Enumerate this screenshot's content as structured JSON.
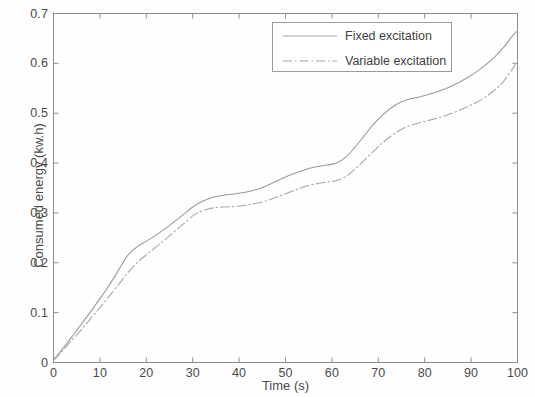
{
  "chart_data": {
    "type": "line",
    "title": "",
    "xlabel": "Time (s)",
    "ylabel": "Consumed energy (kw.h)",
    "xlim": [
      0,
      100
    ],
    "ylim": [
      0,
      0.7
    ],
    "xticks": [
      "0",
      "10",
      "20",
      "30",
      "40",
      "50",
      "60",
      "70",
      "80",
      "90",
      "100"
    ],
    "xtick_values": [
      0,
      10,
      20,
      30,
      40,
      50,
      60,
      70,
      80,
      90,
      100
    ],
    "yticks": [
      "0",
      "0.1",
      "0.2",
      "0.3",
      "0.4",
      "0.5",
      "0.6",
      "0.7"
    ],
    "ytick_values": [
      0,
      0.1,
      0.2,
      0.3,
      0.4,
      0.5,
      0.6,
      0.7
    ],
    "grid": false,
    "legend_position": "top-right",
    "x": [
      0,
      2,
      4,
      6,
      8,
      10,
      12,
      14,
      16,
      18,
      20,
      22,
      24,
      26,
      28,
      30,
      31,
      33,
      35,
      37,
      39,
      41,
      43,
      45,
      47,
      49,
      51,
      53,
      55,
      57,
      59,
      61,
      63,
      65,
      67,
      69,
      71,
      73,
      75,
      77,
      79,
      81,
      83,
      85,
      87,
      89,
      91,
      93,
      95,
      97,
      99,
      100
    ],
    "series": [
      {
        "name": "Fixed excitation",
        "style": "solid",
        "color": "#9a9a9a",
        "values": [
          0.005,
          0.028,
          0.052,
          0.077,
          0.102,
          0.128,
          0.155,
          0.185,
          0.215,
          0.232,
          0.243,
          0.255,
          0.268,
          0.282,
          0.297,
          0.312,
          0.318,
          0.327,
          0.333,
          0.336,
          0.338,
          0.341,
          0.345,
          0.351,
          0.359,
          0.368,
          0.376,
          0.383,
          0.389,
          0.393,
          0.396,
          0.4,
          0.412,
          0.432,
          0.455,
          0.478,
          0.497,
          0.512,
          0.523,
          0.529,
          0.533,
          0.538,
          0.544,
          0.551,
          0.56,
          0.57,
          0.582,
          0.596,
          0.612,
          0.632,
          0.656,
          0.665
        ]
      },
      {
        "name": "Variable excitation",
        "style": "dash-dot",
        "color": "#a8a8a8",
        "values": [
          0.004,
          0.024,
          0.045,
          0.066,
          0.088,
          0.11,
          0.133,
          0.156,
          0.18,
          0.2,
          0.216,
          0.231,
          0.246,
          0.262,
          0.278,
          0.294,
          0.3,
          0.307,
          0.311,
          0.312,
          0.313,
          0.315,
          0.318,
          0.322,
          0.328,
          0.335,
          0.342,
          0.349,
          0.355,
          0.359,
          0.362,
          0.365,
          0.373,
          0.388,
          0.406,
          0.424,
          0.441,
          0.456,
          0.468,
          0.476,
          0.481,
          0.486,
          0.491,
          0.497,
          0.504,
          0.512,
          0.521,
          0.532,
          0.546,
          0.564,
          0.59,
          0.605
        ]
      }
    ]
  },
  "legend": {
    "entries": [
      {
        "label": "Fixed excitation"
      },
      {
        "label": "Variable excitation"
      }
    ]
  },
  "axes": {
    "x_title": "Time (s)",
    "y_title": "Consumed energy (kw.h)"
  }
}
